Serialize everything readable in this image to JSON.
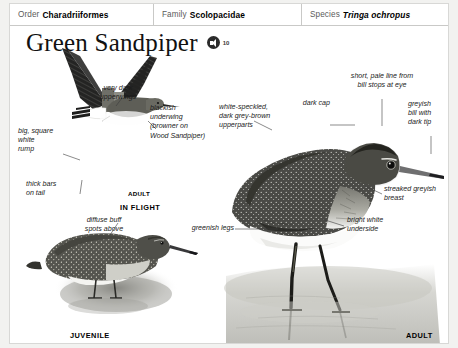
{
  "taxonomy": {
    "order": {
      "key": "Order",
      "value": "Charadriiformes"
    },
    "family": {
      "key": "Family",
      "value": "Scolopacidae"
    },
    "species": {
      "key": "Species",
      "value": "Tringa ochropus"
    }
  },
  "title": {
    "name": "Green Sandpiper",
    "sound_icon": "speaker-icon",
    "sound_count": "10"
  },
  "annotations": {
    "very_dark_upperwings": "very dark\nupperwings",
    "blackish_underwing": "blackish\nunderwing\n(browner on\nWood Sandpiper)",
    "big_square_white_rump": "big, square\nwhite\nrump",
    "thick_bars_on_tail": "thick bars\non tail",
    "white_speckled_upperparts": "white-speckled,\ndark grey-brown\nupperparts",
    "dark_cap": "dark cap",
    "short_pale_line": "short, pale line from\nbill stops at eye",
    "greyish_bill": "greyish\nbill with\ndark tip",
    "streaked_greyish_breast": "streaked greyish\nbreast",
    "bright_white_underside": "bright white\nunderside",
    "greenish_legs": "greenish legs",
    "diffuse_buff_spots": "diffuse buff\nspots above"
  },
  "plate_labels": {
    "adult_flight_age": "ADULT",
    "in_flight": "IN FLIGHT",
    "juvenile": "JUVENILE",
    "adult": "ADULT"
  },
  "colors": {
    "page_background": "#f2f2f0",
    "sheet": "#ffffff",
    "rule": "#c9c9c7",
    "text": "#1a1a1a",
    "label_grey": "#5b5b5b",
    "plumage_dark": "#3a3a38",
    "plumage_darkest": "#1d1d1c",
    "plumage_mid": "#6e6e6a",
    "water": "#dcdcd8"
  }
}
